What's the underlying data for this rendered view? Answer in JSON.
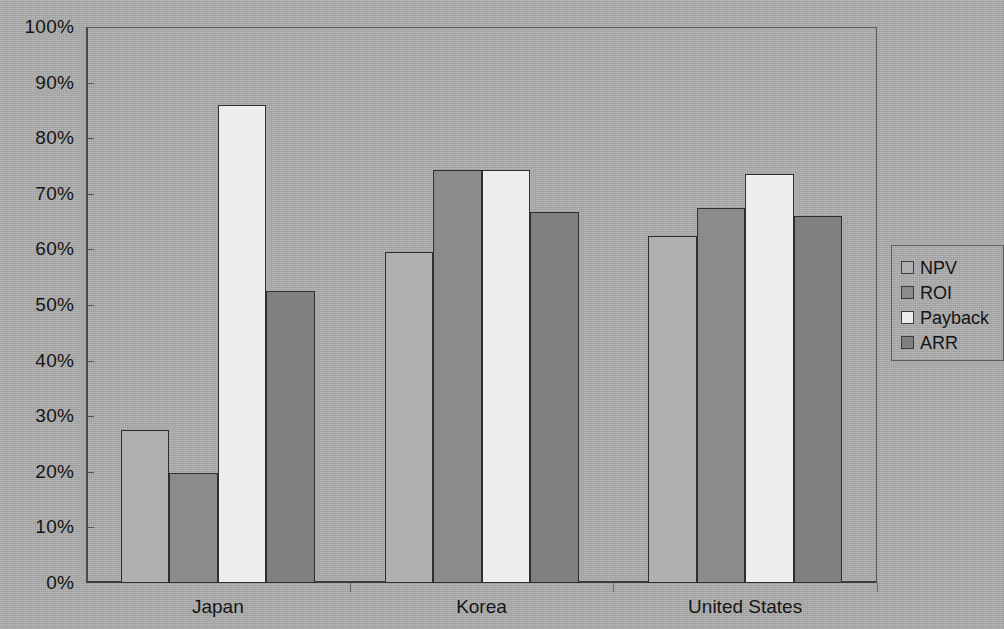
{
  "chart_data": {
    "type": "bar",
    "title": "",
    "subtitle": "",
    "xlabel": "",
    "ylabel": "",
    "categories": [
      "Japan",
      "Korea",
      "United States"
    ],
    "series": [
      {
        "name": "NPV",
        "color": "#b0b0b0",
        "values": [
          27.5,
          59.5,
          62.5
        ]
      },
      {
        "name": "ROI",
        "color": "#8b8b8b",
        "values": [
          19.8,
          74.3,
          67.5
        ]
      },
      {
        "name": "Payback",
        "color": "#ededed",
        "values": [
          86.0,
          74.2,
          73.5
        ]
      },
      {
        "name": "ARR",
        "color": "#808080",
        "values": [
          52.5,
          66.8,
          66.0
        ]
      }
    ],
    "ylim": [
      0,
      100
    ],
    "ytick_labels": [
      "100%",
      "90%",
      "80%",
      "70%",
      "60%",
      "50%",
      "40%",
      "30%",
      "20%",
      "10%",
      "0%"
    ],
    "ytick_values": [
      100,
      90,
      80,
      70,
      60,
      50,
      40,
      30,
      20,
      10,
      0
    ],
    "grid": false,
    "legend_position": "right",
    "legend_entries": [
      "NPV",
      "ROI",
      "Payback",
      "ARR"
    ],
    "value_unit": "%",
    "background_color": "#adadad",
    "axis_color": "#3c3c3c"
  }
}
